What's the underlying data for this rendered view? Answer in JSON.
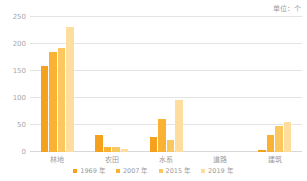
{
  "unit_caption": "单位：个",
  "chart_data": {
    "type": "bar",
    "title": "",
    "subtitle": "",
    "xlabel": "",
    "ylabel": "",
    "unit": "个",
    "ylim": [
      0,
      250
    ],
    "yticks": [
      0,
      50,
      100,
      150,
      200,
      250
    ],
    "ytick_labels": [
      "0",
      "50",
      "100",
      "150",
      "200",
      "250"
    ],
    "grid": true,
    "legend_position": "bottom",
    "categories": [
      "林地",
      "农田",
      "水系",
      "道路",
      "建筑"
    ],
    "series": [
      {
        "name": "1969 年",
        "color": "#f5a11d",
        "values": [
          159,
          32,
          28,
          0,
          4
        ]
      },
      {
        "name": "2007 年",
        "color": "#f9b233",
        "values": [
          185,
          9,
          61,
          0,
          32
        ]
      },
      {
        "name": "2015 年",
        "color": "#fbc85f",
        "values": [
          192,
          10,
          23,
          0,
          48
        ]
      },
      {
        "name": "2019 年",
        "color": "#fdde9e",
        "values": [
          232,
          5,
          96,
          0,
          55
        ]
      }
    ]
  },
  "colors": {
    "series_1969": "#f5a11d",
    "series_2007": "#f9b233",
    "series_2015": "#fbc85f",
    "series_2019": "#fdde9e",
    "gridline": "#e4e4e4",
    "axis": "#d8d8d8",
    "text": "#9b9b9b",
    "background": "#ffffff"
  }
}
